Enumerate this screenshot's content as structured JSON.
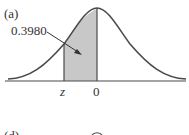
{
  "panel_a": {
    "label": "(a)",
    "area_label": "0.3980",
    "tick_labels": [
      "z",
      "0"
    ],
    "shade_color": "#c8c8c8",
    "curve_color": "#4a4a4a"
  },
  "panel_d": {
    "label": "(d)"
  }
}
